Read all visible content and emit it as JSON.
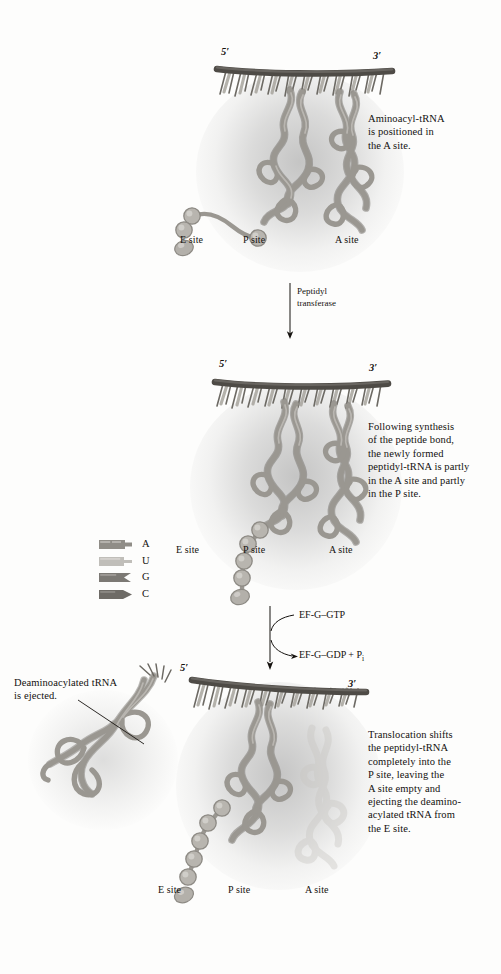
{
  "figure": {
    "title_present": false,
    "background": "#fdfdfc",
    "ink": "#15120f"
  },
  "palette": {
    "mrna_backbone": "#4e4b46",
    "codon_tooth_light": "#a8a59e",
    "codon_tooth_dark": "#6d6a64",
    "trna_ribbon": "#9a9791",
    "trna_ribbon_shade": "#7c7974",
    "trna_ghost": "#c9c7c3",
    "bead": "#b3b0aa",
    "glow": "#9a9a9a"
  },
  "panels": [
    {
      "id": "panel-1",
      "stage": "aminoacyl-trna-binding",
      "caption": "Aminoacyl-tRNA\nis positioned in\nthe A site.",
      "mrna_5_label": "5′",
      "mrna_3_label": "3′",
      "sites": [
        {
          "label": "E site"
        },
        {
          "label": "P site"
        },
        {
          "label": "A site"
        }
      ],
      "trna_count": 2,
      "bead_count": 4,
      "a_site_occupied": true,
      "e_site_occupied": false
    },
    {
      "id": "panel-2",
      "stage": "peptide-bond-formed",
      "caption": "Following synthesis\nof the peptide bond,\nthe newly formed\npeptidyl-tRNA is partly\nin the A site and partly\nin the P site.",
      "mrna_5_label": "5′",
      "mrna_3_label": "3′",
      "sites": [
        {
          "label": "E site"
        },
        {
          "label": "P site"
        },
        {
          "label": "A site"
        }
      ],
      "trna_count": 2,
      "bead_count": 5,
      "a_site_occupied": true,
      "e_site_occupied": false
    },
    {
      "id": "panel-3",
      "stage": "translocation-complete",
      "caption": "Translocation shifts\nthe peptidyl-tRNA\ncompletely into the\nP site, leaving the\nA site empty and\nejecting the deamino-\nacylated tRNA from\nthe E site.",
      "mrna_5_label": "5′",
      "mrna_3_label": "3′",
      "sites": [
        {
          "label": "E site"
        },
        {
          "label": "P site"
        },
        {
          "label": "A site"
        }
      ],
      "annotation": "Deaminoacylated tRNA\nis ejected.",
      "trna_count": 2,
      "bead_count": 5,
      "a_site_occupied": false,
      "a_site_ghost": true,
      "e_site_occupied": false
    }
  ],
  "transitions": [
    {
      "id": "transition-1",
      "from_panel": "panel-1",
      "to_panel": "panel-2",
      "label": "Peptidyl\ntransferase",
      "style": "straight-down-arrow"
    },
    {
      "id": "transition-2",
      "from_panel": "panel-2",
      "to_panel": "panel-3",
      "label_in": "EF-G–GTP",
      "label_out_prefix": "EF-G–GDP + P",
      "label_out_subscript": "i",
      "style": "down-arrow-with-curved-in-and-out"
    }
  ],
  "legend": {
    "items": [
      {
        "letter": "A",
        "shape": "nucleotide-a",
        "fill": "#908d87",
        "notch": "square-notch"
      },
      {
        "letter": "U",
        "shape": "nucleotide-u",
        "fill": "#c0beb9",
        "notch": "round-peg"
      },
      {
        "letter": "G",
        "shape": "nucleotide-g",
        "fill": "#7c7974",
        "notch": "v-notch"
      },
      {
        "letter": "C",
        "shape": "nucleotide-c",
        "fill": "#6e6b66",
        "notch": "arrow-point"
      }
    ]
  }
}
